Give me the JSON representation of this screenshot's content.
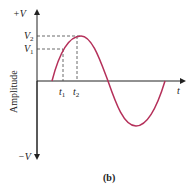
{
  "figure": {
    "caption": "(b)",
    "y_axis_label": "Amplitude",
    "x_axis_label": "t",
    "y_top_label": "+V",
    "y_bottom_label": "−V",
    "levels": [
      {
        "name": "V",
        "sub": "2"
      },
      {
        "name": "V",
        "sub": "1"
      }
    ],
    "times": [
      {
        "name": "t",
        "sub": "1"
      },
      {
        "name": "t",
        "sub": "2"
      }
    ],
    "curve_color": "#b5305a",
    "axis_color": "#222222"
  }
}
